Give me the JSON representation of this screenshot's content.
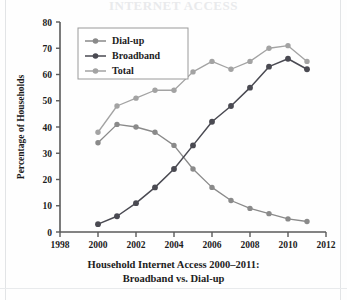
{
  "title": "INTERNET ACCESS",
  "caption": {
    "line1": "Household Internet Access 2000–2011:",
    "line2": "Broadband vs. Dial-up"
  },
  "legend": {
    "items": [
      {
        "label": "Dial-up",
        "color": "#8a8a8a"
      },
      {
        "label": "Broadband",
        "color": "#4a4a52"
      },
      {
        "label": "Total",
        "color": "#a3a3a3"
      }
    ]
  },
  "axes": {
    "ylabel": "Percentage of Households",
    "yticks": [
      "0",
      "10",
      "20",
      "30",
      "40",
      "50",
      "60",
      "70",
      "80"
    ],
    "xticks": [
      "1998",
      "2000",
      "2002",
      "2004",
      "2006",
      "2008",
      "2010",
      "2012"
    ]
  },
  "chart_data": {
    "type": "line",
    "title": "Household Internet Access 2000–2011: Broadband vs. Dial-up",
    "xlabel": "",
    "ylabel": "Percentage of Households",
    "xlim": [
      1998,
      2012
    ],
    "ylim": [
      0,
      80
    ],
    "ytick_step": 10,
    "xtick_step": 2,
    "grid": false,
    "legend_position": "top-left",
    "x": [
      2000,
      2001,
      2002,
      2003,
      2004,
      2005,
      2006,
      2007,
      2008,
      2009,
      2010,
      2011
    ],
    "series": [
      {
        "name": "Dial-up",
        "color": "#8a8a8a",
        "values": [
          34,
          41,
          40,
          38,
          33,
          24,
          17,
          12,
          9,
          7,
          5,
          4
        ]
      },
      {
        "name": "Broadband",
        "color": "#4a4a52",
        "values": [
          3,
          6,
          11,
          17,
          24,
          33,
          42,
          48,
          55,
          63,
          66,
          62
        ]
      },
      {
        "name": "Total",
        "color": "#a3a3a3",
        "values": [
          38,
          48,
          51,
          54,
          54,
          61,
          65,
          62,
          65,
          70,
          71,
          65
        ]
      }
    ]
  }
}
